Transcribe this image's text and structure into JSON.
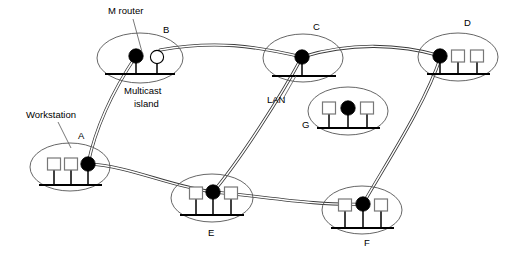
{
  "diagram": {
    "colors": {
      "router_multicast": "#000000",
      "router_nonmulticast": "#ffffff",
      "workstation": "#ffffff",
      "island_outline": "#555555",
      "tunnel": "#3a3a3a",
      "lan_bar": "#000000",
      "background": "#ffffff"
    },
    "annotations": [
      {
        "id": "m-router",
        "text": "M router",
        "x": 108,
        "y": 14,
        "leader": {
          "x1": 133,
          "y1": 19,
          "x2": 142,
          "y2": 52
        }
      },
      {
        "id": "multicast-island",
        "text_line1": "Multicast",
        "text_line2": "island",
        "x": 124,
        "y": 94
      },
      {
        "id": "workstation",
        "text": "Workstation",
        "x": 26,
        "y": 118,
        "leader": {
          "x1": 58,
          "y1": 122,
          "x2": 71,
          "y2": 148
        }
      },
      {
        "id": "lan",
        "text": "LAN",
        "x": 267,
        "y": 103,
        "leader": {
          "x1": 283,
          "y1": 99,
          "x2": 296,
          "y2": 76
        }
      }
    ],
    "islands": [
      {
        "id": "B",
        "label": "B",
        "label_x": 163,
        "label_y": 33,
        "cx": 140,
        "cy": 58,
        "rx": 43,
        "ry": 25,
        "bar": {
          "x1": 105,
          "y1": 74,
          "x2": 175,
          "y2": 74
        },
        "nodes": [
          {
            "type": "m-router",
            "cx": 136,
            "cy": 56,
            "r": 7.2,
            "stem_to": 74
          },
          {
            "type": "non-m-router",
            "cx": 157,
            "cy": 57,
            "r": 6.6,
            "stem_to": 74
          }
        ]
      },
      {
        "id": "C",
        "label": "C",
        "label_x": 313,
        "label_y": 30,
        "cx": 303,
        "cy": 58,
        "rx": 40,
        "ry": 24,
        "bar": {
          "x1": 272,
          "y1": 76,
          "x2": 336,
          "y2": 76
        },
        "nodes": [
          {
            "type": "m-router",
            "cx": 302,
            "cy": 57,
            "r": 7.2,
            "stem_to": 76
          }
        ]
      },
      {
        "id": "D",
        "label": "D",
        "label_x": 464,
        "label_y": 26,
        "cx": 458,
        "cy": 57,
        "rx": 40,
        "ry": 24,
        "bar": {
          "x1": 427,
          "y1": 74,
          "x2": 490,
          "y2": 74
        },
        "nodes": [
          {
            "type": "m-router",
            "cx": 440,
            "cy": 56,
            "r": 7.2,
            "stem_to": 74
          },
          {
            "type": "workstation",
            "cx": 458,
            "cy": 56,
            "w": 13,
            "h": 12,
            "stem_to": 74
          },
          {
            "type": "workstation",
            "cx": 477,
            "cy": 56,
            "w": 13,
            "h": 12,
            "stem_to": 74
          }
        ]
      },
      {
        "id": "G",
        "label": "G",
        "label_x": 302,
        "label_y": 128,
        "cx": 348,
        "cy": 111,
        "rx": 40,
        "ry": 24,
        "bar": {
          "x1": 317,
          "y1": 128,
          "x2": 380,
          "y2": 128
        },
        "nodes": [
          {
            "type": "workstation",
            "cx": 329,
            "cy": 108,
            "w": 13,
            "h": 12,
            "stem_to": 128
          },
          {
            "type": "m-router",
            "cx": 348,
            "cy": 108,
            "r": 7.2,
            "stem_to": 128
          },
          {
            "type": "workstation",
            "cx": 367,
            "cy": 108,
            "w": 13,
            "h": 12,
            "stem_to": 128
          }
        ]
      },
      {
        "id": "A",
        "label": "A",
        "label_x": 78,
        "label_y": 139,
        "cx": 70,
        "cy": 167,
        "rx": 40,
        "ry": 24,
        "bar": {
          "x1": 39,
          "y1": 185,
          "x2": 102,
          "y2": 185
        },
        "nodes": [
          {
            "type": "workstation",
            "cx": 54,
            "cy": 164,
            "w": 13,
            "h": 12,
            "stem_to": 185
          },
          {
            "type": "workstation",
            "cx": 71,
            "cy": 164,
            "w": 13,
            "h": 12,
            "stem_to": 185
          },
          {
            "type": "m-router",
            "cx": 88,
            "cy": 164,
            "r": 7.2,
            "stem_to": 185
          }
        ]
      },
      {
        "id": "E",
        "label": "E",
        "label_x": 208,
        "label_y": 236,
        "cx": 212,
        "cy": 198,
        "rx": 41,
        "ry": 24,
        "bar": {
          "x1": 180,
          "y1": 215,
          "x2": 244,
          "y2": 215
        },
        "nodes": [
          {
            "type": "workstation",
            "cx": 196,
            "cy": 193,
            "w": 13,
            "h": 12,
            "stem_to": 215
          },
          {
            "type": "m-router",
            "cx": 213,
            "cy": 192,
            "r": 7.2,
            "stem_to": 215
          },
          {
            "type": "workstation",
            "cx": 231,
            "cy": 193,
            "w": 13,
            "h": 12,
            "stem_to": 215
          }
        ]
      },
      {
        "id": "F",
        "label": "F",
        "label_x": 364,
        "label_y": 246,
        "cx": 362,
        "cy": 210,
        "rx": 40,
        "ry": 24,
        "bar": {
          "x1": 331,
          "y1": 228,
          "x2": 394,
          "y2": 228
        },
        "nodes": [
          {
            "type": "workstation",
            "cx": 345,
            "cy": 205,
            "w": 13,
            "h": 12,
            "stem_to": 228
          },
          {
            "type": "m-router",
            "cx": 363,
            "cy": 204,
            "r": 7.2,
            "stem_to": 228
          },
          {
            "type": "workstation",
            "cx": 381,
            "cy": 205,
            "w": 13,
            "h": 12,
            "stem_to": 228
          }
        ]
      }
    ],
    "tunnels": [
      {
        "id": "B-C",
        "from": "B",
        "to": "C",
        "path": "M 160,50 C 215,40 255,46 302,57"
      },
      {
        "id": "C-D",
        "from": "C",
        "to": "D",
        "path": "M 302,57 C 350,42 400,44 441,56"
      },
      {
        "id": "A-B",
        "from": "A",
        "to": "B",
        "path": "M 88,164 C 95,130 112,92 136,56"
      },
      {
        "id": "C-E",
        "from": "C",
        "to": "E",
        "path": "M 302,57 C 281,96 240,160 213,192"
      },
      {
        "id": "D-F",
        "from": "D",
        "to": "F",
        "path": "M 441,56 C 425,105 385,165 363,204"
      },
      {
        "id": "A-E",
        "from": "A",
        "to": "E",
        "path": "M 88,164 C 130,166 168,186 213,192"
      },
      {
        "id": "E-F",
        "from": "E",
        "to": "F",
        "path": "M 213,192 C 262,196 315,206 363,204"
      }
    ]
  }
}
